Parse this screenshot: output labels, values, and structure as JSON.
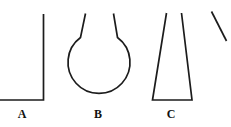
{
  "figure": {
    "kind": "laboratory-glassware-outline-figure",
    "background_color": "#ffffff",
    "stroke_color": "#1c1c1c",
    "width": 231,
    "height": 127,
    "items": [
      {
        "id": "A",
        "label": "A",
        "icon_name": "beaker-outline-icon",
        "description": "straight-walled open vessel, clipped at left edge of image",
        "label_x": 22,
        "label_y": 108
      },
      {
        "id": "B",
        "label": "B",
        "icon_name": "round-bottom-flask-outline-icon",
        "description": "round bottom flask with flared neck",
        "label_x": 98,
        "label_y": 108
      },
      {
        "id": "C",
        "label": "C",
        "icon_name": "conical-flask-outline-icon",
        "description": "conical Erlenmeyer flask with flat base and narrow neck",
        "label_x": 171,
        "label_y": 108
      },
      {
        "id": "D",
        "label": "",
        "icon_name": "partial-flask-edge-icon",
        "description": "diagonal stroke of a fourth vessel, cut off at right edge of image",
        "label_x": 0,
        "label_y": 0
      }
    ]
  }
}
